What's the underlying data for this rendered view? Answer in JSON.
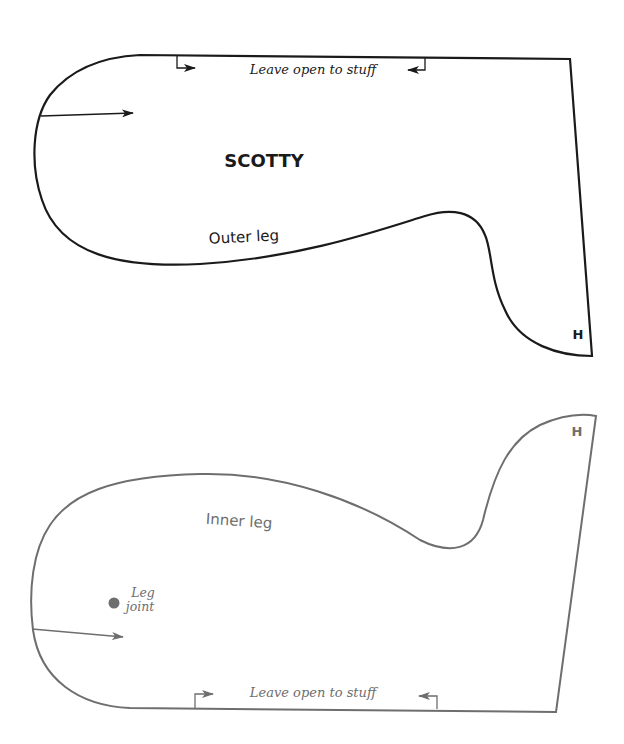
{
  "colors": {
    "outer_piece": "#1a1a1a",
    "inner_piece": "#6e6e6e",
    "background": "#ffffff"
  },
  "outer_piece": {
    "title": "SCOTTY",
    "piece_label": "Outer leg",
    "opening_note": "Leave open to stuff",
    "match_mark": "H",
    "grainline_icon": "arrow-right"
  },
  "inner_piece": {
    "piece_label": "Inner leg",
    "opening_note": "Leave open to stuff",
    "match_mark": "H",
    "joint_label_line1": "Leg",
    "joint_label_line2": "joint",
    "joint_marker_icon": "filled-dot",
    "grainline_icon": "arrow-right"
  }
}
